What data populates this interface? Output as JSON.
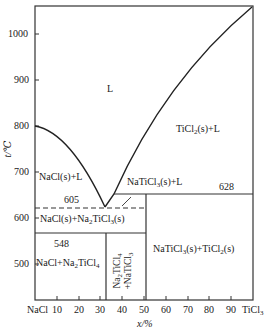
{
  "diagram": {
    "type": "binary_phase_diagram",
    "system": "NaCl-TiCl3",
    "axes": {
      "x_label": "x/%",
      "y_label": "t/℃",
      "x_left_component": "NaCl",
      "x_right_component": "TiCl3",
      "x_ticks": [
        "10",
        "20",
        "30",
        "40",
        "50",
        "60",
        "70",
        "80",
        "90"
      ],
      "y_ticks": [
        "1000",
        "900",
        "800",
        "700",
        "600",
        "500"
      ],
      "x_range": [
        0,
        100
      ],
      "y_range": [
        425,
        1062
      ]
    },
    "temperatures": {
      "eutectic_605": "605",
      "peritectic_628": "628",
      "eutectoid_548": "548"
    },
    "regions": {
      "liquid": "L",
      "ticl2_l": {
        "a": "TiCl",
        "s1": "2",
        "b": "(s)+L"
      },
      "nacl_l": "NaCl(s)+L",
      "naticl3_l": "NaTiCl3(s)+L",
      "nacl_na2ticl3": {
        "a": "NaCl(s)+Na",
        "s1": "2",
        "b": "TiCl",
        "s2": "3",
        "c": "(s)"
      },
      "nacl_na2ticl4": {
        "a": "NaCl+Na",
        "s1": "2",
        "b": "TiCl",
        "s2": "4"
      },
      "na2ticl4_naticl3": {
        "line1a": "Na",
        "s1": "2",
        "line1b": "TiCl",
        "s2": "4",
        "line2a": "+NaTiCl",
        "s3": "3"
      },
      "naticl3_ticl2": {
        "a": "NaTiCl",
        "s1": "3",
        "b": "(s)+TiCl",
        "s2": "2",
        "c": "(s)"
      }
    },
    "key_points": [
      {
        "name": "NaCl melting point",
        "x": 0,
        "t": 800
      },
      {
        "name": "eutectic",
        "x": 31,
        "t": 605
      },
      {
        "name": "peritectic",
        "x": 50,
        "t": 628
      },
      {
        "name": "eutectoid",
        "x": 31,
        "t": 548
      },
      {
        "name": "TiCl2 liquidus end",
        "x": 100,
        "t": 1060
      }
    ]
  }
}
